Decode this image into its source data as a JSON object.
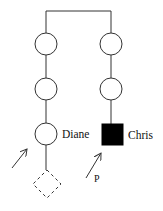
{
  "diagram": {
    "type": "pedigree",
    "labels": {
      "diane": "Diane",
      "chris": "Chris",
      "proband": "P"
    },
    "colors": {
      "line": "#333333",
      "affected_fill": "#000000",
      "unaffected_fill": "#ffffff"
    },
    "nodes": [
      {
        "id": "left-1",
        "shape": "circle",
        "sex": "female",
        "affected": false
      },
      {
        "id": "left-2",
        "shape": "circle",
        "sex": "female",
        "affected": false
      },
      {
        "id": "diane",
        "shape": "circle",
        "sex": "female",
        "affected": false,
        "label": "Diane"
      },
      {
        "id": "left-child",
        "shape": "diamond",
        "sex": "unknown",
        "dashed": true,
        "note": "pregnancy / unborn"
      },
      {
        "id": "right-1",
        "shape": "circle",
        "sex": "female",
        "affected": false
      },
      {
        "id": "right-2",
        "shape": "circle",
        "sex": "female",
        "affected": false
      },
      {
        "id": "chris",
        "shape": "square",
        "sex": "male",
        "affected": true,
        "label": "Chris",
        "proband": true
      }
    ],
    "arrows": [
      {
        "id": "consultand-arrow",
        "target": "diane",
        "label": ""
      },
      {
        "id": "proband-arrow",
        "target": "chris",
        "label": "P"
      }
    ]
  }
}
